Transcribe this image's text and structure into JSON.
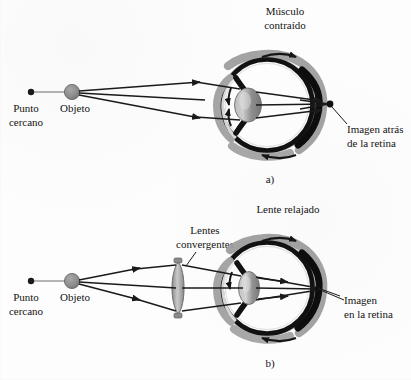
{
  "figure": {
    "title_alt": "Correccion de la miopia con lentes convergentes",
    "background_color": "#fdfdfd",
    "ink_color": "#141414",
    "sclera_color": "#111111",
    "tissue_gray": "#9a9a9a",
    "lens_gray": "#8d8d8d",
    "ray_color": "#1a1a1a"
  },
  "panel_a": {
    "letter": "a)",
    "labels": {
      "near_point_line1": "Punto",
      "near_point_line2": "cercano",
      "object": "Objeto",
      "muscle_line1": "Músculo",
      "muscle_line2": "contraído",
      "image_line1": "Imagen atrás",
      "image_line2": "de la retina"
    }
  },
  "panel_b": {
    "letter": "b)",
    "labels": {
      "near_point_line1": "Punto",
      "near_point_line2": "cercano",
      "object": "Objeto",
      "lens_line1": "Lentes",
      "lens_line2": "convergentes",
      "relaxed_lens": "Lente relajado",
      "image_line1": "Imagen",
      "image_line2": "en la retina"
    }
  }
}
